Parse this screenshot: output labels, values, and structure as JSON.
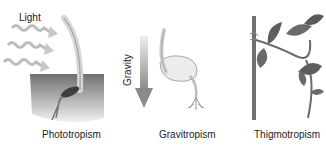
{
  "diagram": {
    "panels": [
      {
        "id": "phototropism",
        "caption": "Phototropism",
        "stimulus_label": "Light",
        "stimulus_icon": "light-wave-arrows"
      },
      {
        "id": "gravitropism",
        "caption": "Gravitropism",
        "stimulus_label": "Gravity",
        "stimulus_icon": "down-arrow"
      },
      {
        "id": "thigmotropism",
        "caption": "Thigmotropism",
        "stimulus_label": "",
        "stimulus_icon": "support-stake"
      }
    ]
  }
}
